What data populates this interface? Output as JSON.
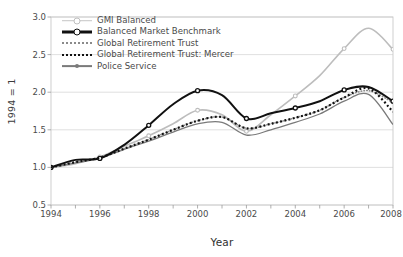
{
  "chart_data": {
    "type": "line",
    "title": "",
    "xlabel": "Year",
    "ylabel": "1994 = 1",
    "xlim": [
      1994,
      2008
    ],
    "ylim": [
      0.5,
      3.0
    ],
    "yticks": [
      "0.5",
      "1.0",
      "1.5",
      "2.0",
      "2.5",
      "3.0"
    ],
    "xticks": [
      "1994",
      "1996",
      "1998",
      "2000",
      "2002",
      "2004",
      "2006",
      "2008"
    ],
    "x": [
      1994,
      1995,
      1996,
      1997,
      1998,
      1999,
      2000,
      2001,
      2002,
      2003,
      2004,
      2005,
      2006,
      2007,
      2008
    ],
    "grid": "horizontal",
    "legend_position": "top-left",
    "series": [
      {
        "name": "GMI Balanced",
        "color": "#bdbdbd",
        "style": "solid-marker",
        "values": [
          1.0,
          1.05,
          1.14,
          1.28,
          1.42,
          1.58,
          1.76,
          1.7,
          1.48,
          1.7,
          1.95,
          2.22,
          2.58,
          2.85,
          2.57
        ]
      },
      {
        "name": "Balanced Market Benchmark",
        "color": "#111111",
        "style": "thick-solid-circle",
        "values": [
          1.0,
          1.1,
          1.12,
          1.3,
          1.56,
          1.84,
          2.02,
          1.96,
          1.65,
          1.72,
          1.79,
          1.88,
          2.03,
          2.07,
          1.88
        ]
      },
      {
        "name": "Global Retirement Trust",
        "color": "#8a8a8a",
        "style": "dotted-fine",
        "values": [
          1.0,
          1.07,
          1.13,
          1.25,
          1.37,
          1.5,
          1.62,
          1.67,
          1.52,
          1.58,
          1.66,
          1.76,
          1.93,
          2.02,
          1.86
        ]
      },
      {
        "name": "Global Retirement Trust: Mercer",
        "color": "#111111",
        "style": "dotted-square",
        "values": [
          1.0,
          1.07,
          1.13,
          1.25,
          1.37,
          1.5,
          1.62,
          1.67,
          1.52,
          1.58,
          1.66,
          1.76,
          1.93,
          2.05,
          1.74
        ]
      },
      {
        "name": "Police Service",
        "color": "#7a7a7a",
        "style": "solid",
        "values": [
          1.0,
          1.06,
          1.12,
          1.24,
          1.35,
          1.47,
          1.58,
          1.6,
          1.43,
          1.5,
          1.6,
          1.71,
          1.88,
          1.97,
          1.57
        ]
      }
    ]
  }
}
